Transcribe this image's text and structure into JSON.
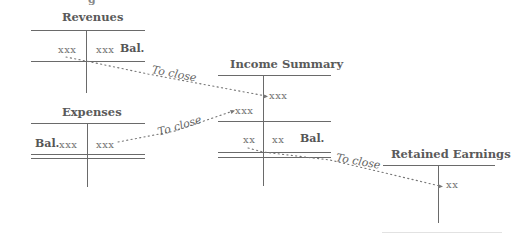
{
  "top_fragment": "g",
  "accounts": {
    "revenues": {
      "title": "Revenues",
      "debit": "xxx",
      "credit": "xxx",
      "balance_label": "Bal."
    },
    "expenses": {
      "title": "Expenses",
      "balance_label": "Bal.",
      "debit": "xxx",
      "credit": "xxx"
    },
    "income_summary": {
      "title": "Income Summary",
      "credit_1": "xxx",
      "debit_1": "xxx",
      "debit_2": "xx",
      "credit_2": "xx",
      "balance_label": "Bal."
    },
    "retained_earnings": {
      "title": "Retained Earnings",
      "credit": "xx"
    }
  },
  "arrows": [
    {
      "from": "revenues",
      "to": "income_summary",
      "label": "To close"
    },
    {
      "from": "expenses",
      "to": "income_summary",
      "label": "To close"
    },
    {
      "from": "income_summary",
      "to": "retained_earnings",
      "label": "To close"
    }
  ],
  "colors": {
    "line": "#6a6a6a",
    "text": "#555555",
    "dots": "#777777"
  }
}
